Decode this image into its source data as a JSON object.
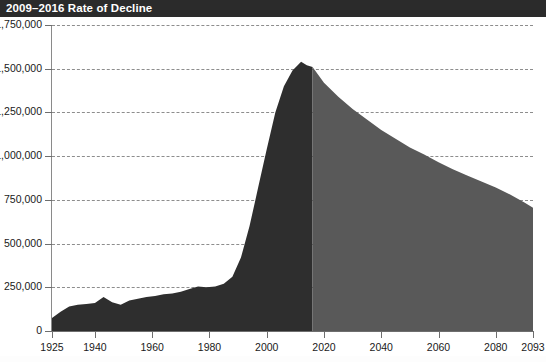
{
  "header": {
    "title": "2009–2016 Rate of Decline"
  },
  "colors": {
    "header_bg": "#2b2b2b",
    "header_text": "#ffffff",
    "historical_area": "#2e2e2e",
    "projected_area": "#595959",
    "gridline": "#8d8d8d",
    "axis": "#6e6e6e",
    "background": "#ffffff"
  },
  "axes": {
    "y_ticks": [
      "0",
      "250,000",
      "500,000",
      "750,000",
      "1,000,000",
      "1,250,000",
      "1,500,000",
      "1,750,000"
    ],
    "x_ticks": [
      "1925",
      "1940",
      "1960",
      "1980",
      "2000",
      "2020",
      "2040",
      "2060",
      "2080",
      "2093"
    ]
  },
  "chart_data": {
    "type": "area",
    "title": "2009–2016 Rate of Decline",
    "xlabel": "",
    "ylabel": "",
    "xlim": [
      1925,
      2093
    ],
    "ylim": [
      0,
      1750000
    ],
    "ytick_values": [
      0,
      250000,
      500000,
      750000,
      1000000,
      1250000,
      1500000,
      1750000
    ],
    "ytick_labels": [
      "0",
      "250,000",
      "500,000",
      "750,000",
      "1,000,000",
      "1,250,000",
      "1,500,000",
      "1,750,000"
    ],
    "xtick_values": [
      1925,
      1940,
      1960,
      1980,
      2000,
      2020,
      2040,
      2060,
      2080,
      2093
    ],
    "xtick_labels": [
      "1925",
      "1940",
      "1960",
      "1980",
      "2000",
      "2020",
      "2040",
      "2060",
      "2080",
      "2093"
    ],
    "grid": "horizontal-dashed",
    "legend": "none",
    "split_year": 2016,
    "series": [
      {
        "name": "Historical",
        "color": "#2e2e2e",
        "x_range": [
          1925,
          2016
        ]
      },
      {
        "name": "Projected",
        "color": "#595959",
        "x_range": [
          2016,
          2093
        ]
      }
    ],
    "x": [
      1925,
      1928,
      1931,
      1934,
      1937,
      1940,
      1943,
      1946,
      1949,
      1952,
      1955,
      1958,
      1961,
      1964,
      1967,
      1970,
      1973,
      1976,
      1979,
      1982,
      1985,
      1988,
      1991,
      1994,
      1997,
      2000,
      2003,
      2006,
      2009,
      2012,
      2014,
      2016,
      2020,
      2025,
      2030,
      2035,
      2040,
      2045,
      2050,
      2055,
      2060,
      2065,
      2070,
      2075,
      2080,
      2085,
      2090,
      2093
    ],
    "values": [
      75000,
      110000,
      140000,
      150000,
      155000,
      160000,
      195000,
      165000,
      150000,
      175000,
      185000,
      195000,
      200000,
      210000,
      215000,
      225000,
      240000,
      255000,
      250000,
      255000,
      270000,
      310000,
      420000,
      600000,
      820000,
      1040000,
      1250000,
      1400000,
      1490000,
      1540000,
      1520000,
      1510000,
      1420000,
      1340000,
      1270000,
      1210000,
      1150000,
      1100000,
      1050000,
      1010000,
      965000,
      925000,
      890000,
      855000,
      820000,
      780000,
      735000,
      705000
    ]
  }
}
